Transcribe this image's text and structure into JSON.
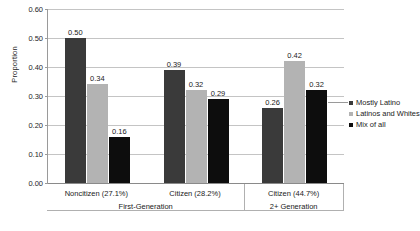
{
  "chart_data": {
    "type": "bar",
    "title": "",
    "xlabel": "",
    "ylabel": "Proportion",
    "ylim": [
      0.0,
      0.6
    ],
    "ytick_step": 0.1,
    "yticks": [
      "0.00",
      "0.10",
      "0.20",
      "0.30",
      "0.40",
      "0.50",
      "0.60"
    ],
    "grid": true,
    "legend_position": "right",
    "categories": [
      "Noncitizen (27.1%)",
      "Citizen (28.2%)",
      "Citizen (44.7%)"
    ],
    "group_labels": [
      "First-Generation",
      "2+ Generation"
    ],
    "groups": [
      {
        "label": "First-Generation",
        "categories": [
          "Noncitizen (27.1%)",
          "Citizen (28.2%)"
        ]
      },
      {
        "label": "2+ Generation",
        "categories": [
          "Citizen (44.7%)"
        ]
      }
    ],
    "series": [
      {
        "name": "Mostly Latino",
        "color": "#3a3a3a",
        "values": [
          0.5,
          0.39,
          0.26
        ],
        "labels": [
          "0.50",
          "0.39",
          "0.26"
        ]
      },
      {
        "name": "Latinos and Whites",
        "color": "#b3b3b3",
        "values": [
          0.34,
          0.32,
          0.42
        ],
        "labels": [
          "0.34",
          "0.32",
          "0.42"
        ]
      },
      {
        "name": "Mix of all",
        "color": "#0d0d0d",
        "values": [
          0.16,
          0.29,
          0.32
        ],
        "labels": [
          "0.16",
          "0.29",
          "0.32"
        ]
      }
    ]
  },
  "legend": {
    "items": [
      {
        "label": "Mostly Latino"
      },
      {
        "label": "Latinos and Whites"
      },
      {
        "label": "Mix of all"
      }
    ]
  }
}
